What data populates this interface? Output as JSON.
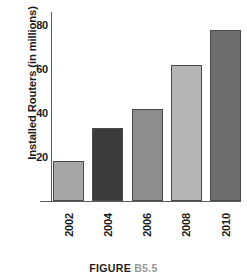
{
  "caption": {
    "label": "FIGURE",
    "number": "B5.5"
  },
  "chart_data": {
    "type": "bar",
    "title": "",
    "xlabel": "",
    "ylabel": "Installed Routers (in millions)",
    "categories": [
      "2002",
      "2004",
      "2006",
      "2008",
      "2010"
    ],
    "values": [
      18,
      33,
      42,
      62,
      78
    ],
    "ylim": [
      0,
      86
    ],
    "yticks": [
      20,
      40,
      60,
      80
    ],
    "ytick_labels": [
      "20",
      "40",
      "60",
      "80"
    ],
    "grid": false,
    "legend": null,
    "bar_colors": [
      "#a6a6a6",
      "#3b3b3b",
      "#8d8d8d",
      "#b5b5b5",
      "#6e6e6e"
    ],
    "bar_edge_color": "#4a4a4a",
    "axis_color": "#5d5d5d",
    "text_color": "#1b1b1b"
  }
}
